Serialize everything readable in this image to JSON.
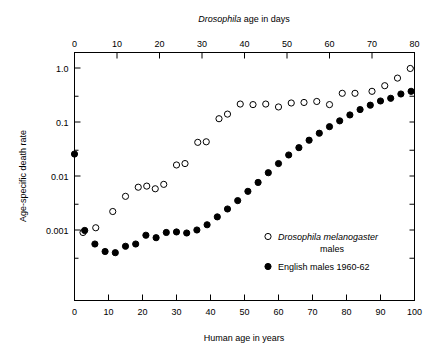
{
  "chart_data": {
    "type": "scatter",
    "title": "",
    "top_axis": {
      "label_plain": "Drosophila age in days",
      "label_italic_part": "Drosophila",
      "label_rest": " age in days",
      "ticks": [
        0,
        10,
        20,
        30,
        40,
        50,
        60,
        70,
        80
      ],
      "range": [
        0,
        80
      ]
    },
    "xlabel": "Human age in years",
    "x_ticks": [
      0,
      10,
      20,
      30,
      40,
      50,
      60,
      70,
      80,
      90,
      100
    ],
    "xlim": [
      0,
      100
    ],
    "ylabel": "Age-specific death rate",
    "y_ticks": [
      "1.0",
      "0.1",
      "0.01",
      "0.001"
    ],
    "y_tick_values": [
      1.0,
      0.1,
      0.01,
      0.001
    ],
    "ylim": [
      0.0004,
      1.3
    ],
    "y_scale": "log",
    "grid": false,
    "legend_position": "inside-lower-right",
    "series": [
      {
        "name": "Drosophila melanogaster males",
        "name_italic_part": "Drosophila melanogaster",
        "name_rest": "males",
        "marker": "open-circle",
        "axis": "top",
        "points": [
          {
            "x": 2,
            "y": 0.0009
          },
          {
            "x": 5,
            "y": 0.0011
          },
          {
            "x": 9,
            "y": 0.0022
          },
          {
            "x": 12,
            "y": 0.0042
          },
          {
            "x": 15,
            "y": 0.0062
          },
          {
            "x": 17,
            "y": 0.0065
          },
          {
            "x": 19,
            "y": 0.0058
          },
          {
            "x": 21,
            "y": 0.007
          },
          {
            "x": 24,
            "y": 0.016
          },
          {
            "x": 26,
            "y": 0.017
          },
          {
            "x": 29,
            "y": 0.042
          },
          {
            "x": 31,
            "y": 0.043
          },
          {
            "x": 34,
            "y": 0.115
          },
          {
            "x": 36,
            "y": 0.14
          },
          {
            "x": 39,
            "y": 0.215
          },
          {
            "x": 42,
            "y": 0.21
          },
          {
            "x": 45,
            "y": 0.215
          },
          {
            "x": 48,
            "y": 0.19
          },
          {
            "x": 51,
            "y": 0.225
          },
          {
            "x": 54,
            "y": 0.23
          },
          {
            "x": 57,
            "y": 0.24
          },
          {
            "x": 60,
            "y": 0.21
          },
          {
            "x": 63,
            "y": 0.34
          },
          {
            "x": 66,
            "y": 0.34
          },
          {
            "x": 70,
            "y": 0.37
          },
          {
            "x": 73,
            "y": 0.47
          },
          {
            "x": 76,
            "y": 0.65
          },
          {
            "x": 79,
            "y": 0.98
          }
        ]
      },
      {
        "name": "English males 1960-62",
        "marker": "filled-circle",
        "axis": "bottom",
        "points": [
          {
            "x": 0,
            "y": 0.0255
          },
          {
            "x": 3,
            "y": 0.00098
          },
          {
            "x": 6,
            "y": 0.00055
          },
          {
            "x": 9,
            "y": 0.0004
          },
          {
            "x": 12,
            "y": 0.00038
          },
          {
            "x": 15,
            "y": 0.0005
          },
          {
            "x": 18,
            "y": 0.00055
          },
          {
            "x": 21,
            "y": 0.0008
          },
          {
            "x": 24,
            "y": 0.00072
          },
          {
            "x": 27,
            "y": 0.0009
          },
          {
            "x": 30,
            "y": 0.00092
          },
          {
            "x": 33,
            "y": 0.00088
          },
          {
            "x": 36,
            "y": 0.001
          },
          {
            "x": 39,
            "y": 0.00125
          },
          {
            "x": 42,
            "y": 0.00175
          },
          {
            "x": 45,
            "y": 0.00245
          },
          {
            "x": 48,
            "y": 0.0035
          },
          {
            "x": 51,
            "y": 0.0052
          },
          {
            "x": 54,
            "y": 0.0076
          },
          {
            "x": 57,
            "y": 0.0115
          },
          {
            "x": 60,
            "y": 0.017
          },
          {
            "x": 63,
            "y": 0.0245
          },
          {
            "x": 66,
            "y": 0.0335
          },
          {
            "x": 69,
            "y": 0.046
          },
          {
            "x": 72,
            "y": 0.062
          },
          {
            "x": 75,
            "y": 0.082
          },
          {
            "x": 78,
            "y": 0.105
          },
          {
            "x": 81,
            "y": 0.135
          },
          {
            "x": 84,
            "y": 0.17
          },
          {
            "x": 87,
            "y": 0.205
          },
          {
            "x": 90,
            "y": 0.245
          },
          {
            "x": 93,
            "y": 0.275
          },
          {
            "x": 96,
            "y": 0.33
          },
          {
            "x": 99,
            "y": 0.37
          }
        ]
      }
    ]
  },
  "legend": {
    "entries": [
      {
        "marker": "open-circle",
        "line1_italic": "Drosophila melanogaster",
        "line2": "males"
      },
      {
        "marker": "filled-circle",
        "line1": "English males 1960-62"
      }
    ]
  }
}
